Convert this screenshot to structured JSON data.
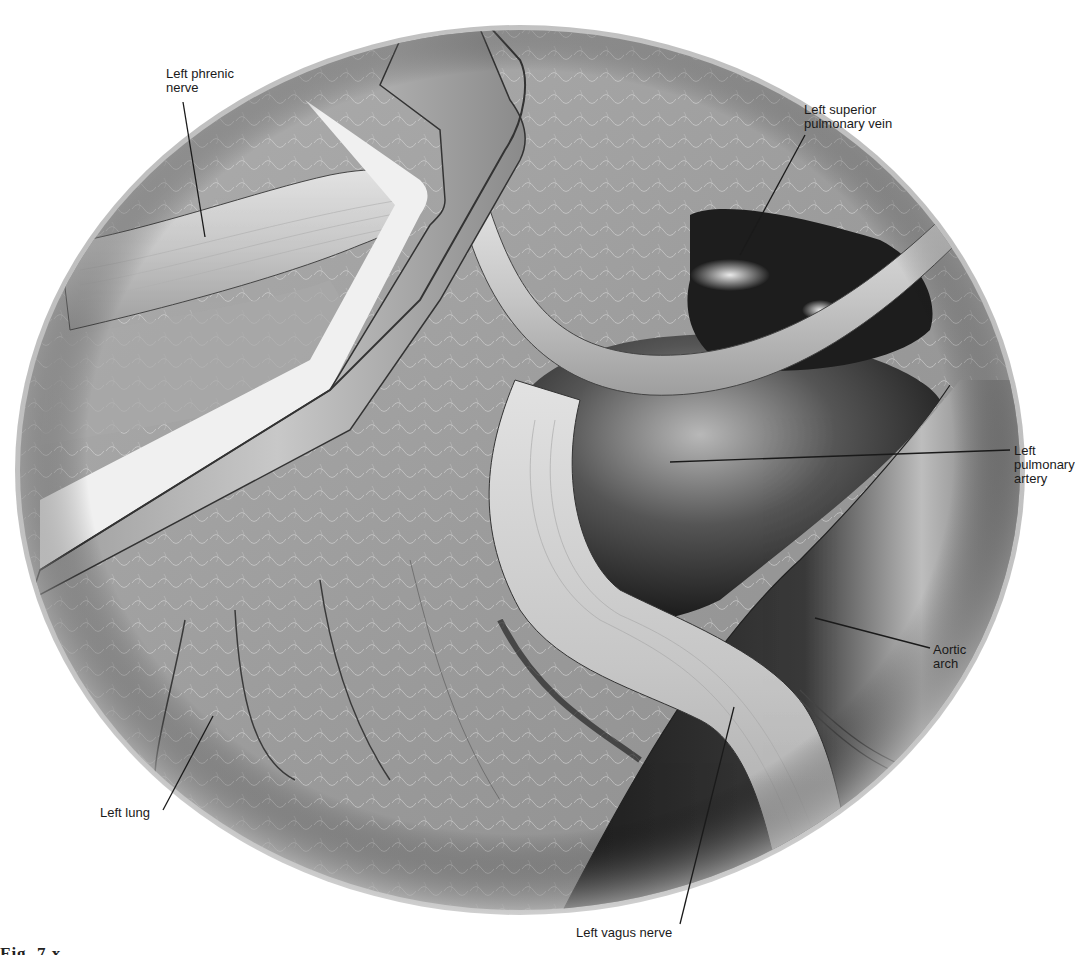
{
  "figure": {
    "type": "anatomical-illustration",
    "palette": {
      "background": "#ffffff",
      "tissue_light": "#c8c8c8",
      "tissue_mid": "#9a9a9a",
      "vessel_dark": "#2a2a2a",
      "nerve_light": "#d6d6d6",
      "retractor": "#b5b5b5",
      "outline": "#333333",
      "label_text": "#1a1a1a"
    },
    "labels": [
      {
        "id": "left-phrenic-nerve",
        "text": "Left phrenic\nnerve"
      },
      {
        "id": "left-superior-pulmonary-vein",
        "text": "Left superior\npulmonary vein"
      },
      {
        "id": "left-pulmonary-artery",
        "text": "Left\npulmonary\nartery"
      },
      {
        "id": "aortic-arch",
        "text": "Aortic\narch"
      },
      {
        "id": "left-lung",
        "text": "Left lung"
      },
      {
        "id": "left-vagus-nerve",
        "text": "Left vagus nerve"
      }
    ],
    "caption_fragment": "Fig. 7.x"
  }
}
